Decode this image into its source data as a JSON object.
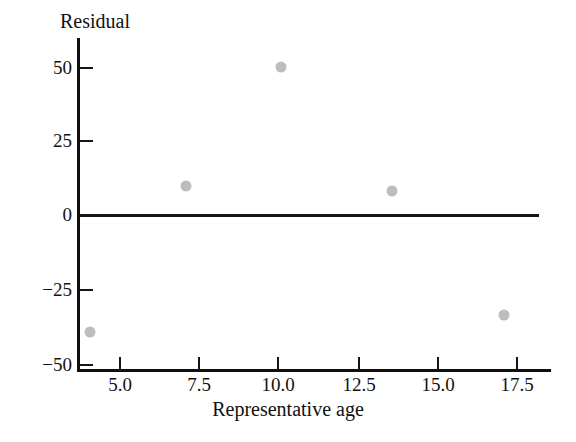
{
  "chart_data": {
    "type": "scatter",
    "title": "",
    "xlabel": "Representative age",
    "ylabel": "Residual",
    "xlim": [
      3.1,
      18.1
    ],
    "ylim": [
      -53,
      57
    ],
    "grid": false,
    "legend": false,
    "reference_line": {
      "orientation": "horizontal",
      "y": 0,
      "label": "0"
    },
    "x_ticks": [
      {
        "value": 5.0,
        "label": "5.0",
        "px": 120
      },
      {
        "value": 7.5,
        "label": "7.5",
        "px": 199
      },
      {
        "value": 10.0,
        "label": "10.0",
        "px": 278
      },
      {
        "value": 12.5,
        "label": "12.5",
        "px": 359
      },
      {
        "value": 15.0,
        "label": "15.0",
        "px": 438
      },
      {
        "value": 17.5,
        "label": "17.5",
        "px": 517
      }
    ],
    "y_ticks": [
      {
        "value": 50,
        "label": "50",
        "px": 68
      },
      {
        "value": 25,
        "label": "25",
        "px": 141
      },
      {
        "value": 0,
        "label": "0",
        "px": 215
      },
      {
        "value": -25,
        "label": "−25",
        "px": 290
      },
      {
        "value": -50,
        "label": "−50",
        "px": 365
      }
    ],
    "points": [
      {
        "x": 4.0,
        "y": -37,
        "px": 90,
        "py": 332
      },
      {
        "x": 7.1,
        "y": 11,
        "px": 186,
        "py": 186
      },
      {
        "x": 10.1,
        "y": 50,
        "px": 281,
        "py": 67
      },
      {
        "x": 13.6,
        "y": 9,
        "px": 392,
        "py": 191
      },
      {
        "x": 16.9,
        "y": -34,
        "px": 504,
        "py": 315
      }
    ],
    "marker_color": "#bdbdbd",
    "axis_color": "#0f0f0f",
    "background_color": "#ffffff"
  }
}
